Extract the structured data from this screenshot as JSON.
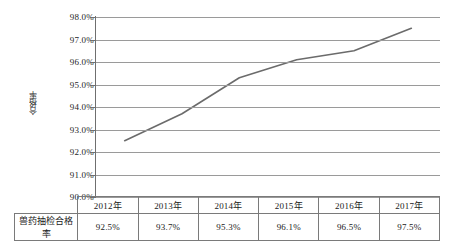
{
  "chart_data": {
    "type": "line",
    "title": "",
    "xlabel": "",
    "ylabel": "合格率",
    "categories": [
      "2012年",
      "2013年",
      "2014年",
      "2015年",
      "2016年",
      "2017年"
    ],
    "values": [
      92.5,
      93.7,
      95.3,
      96.1,
      96.5,
      97.5
    ],
    "value_labels": [
      "92.5%",
      "93.7%",
      "95.3%",
      "96.1%",
      "96.5%",
      "97.5%"
    ],
    "series": [
      {
        "name": "兽药抽检合格率",
        "values": [
          92.5,
          93.7,
          95.3,
          96.1,
          96.5,
          97.5
        ]
      }
    ],
    "ylim": [
      90.0,
      98.0
    ],
    "ytick_values": [
      90.0,
      91.0,
      92.0,
      93.0,
      94.0,
      95.0,
      96.0,
      97.0,
      98.0
    ],
    "ytick_labels": [
      "90.0%",
      "91.0%",
      "92.0%",
      "93.0%",
      "94.0%",
      "95.0%",
      "96.0%",
      "97.0%",
      "98.0%"
    ],
    "grid": true,
    "legend": "none",
    "line_color": "#6b6b6b",
    "grid_color": "#9a9a9a",
    "axis_color": "#6f6f6f"
  },
  "table": {
    "row_header_label": "兽药抽检合格率",
    "columns": [
      "2012年",
      "2013年",
      "2014年",
      "2015年",
      "2016年",
      "2017年"
    ],
    "values": [
      "92.5%",
      "93.7%",
      "95.3%",
      "96.1%",
      "96.5%",
      "97.5%"
    ]
  }
}
